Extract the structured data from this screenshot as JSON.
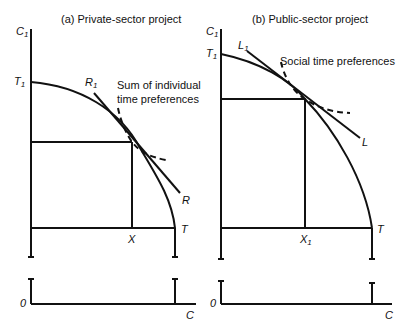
{
  "panels": [
    {
      "id": "a",
      "title": "(a) Private-sector project",
      "y_axis_label": "C",
      "y_axis_sub": "1",
      "x_axis_label": "C",
      "origin_label": "0",
      "curve_intercept_y": "T",
      "curve_intercept_y_sub": "1",
      "curve_intercept_x": "T",
      "tangent_top_label": "R",
      "tangent_top_sub": "1",
      "tangent_bottom_label": "R",
      "point_label": "X",
      "point_sub": "",
      "annotation_line1": "Sum of individual",
      "annotation_line2": "time preferences"
    },
    {
      "id": "b",
      "title": "(b) Public-sector project",
      "y_axis_label": "C",
      "y_axis_sub": "1",
      "x_axis_label": "C",
      "origin_label": "0",
      "curve_intercept_y": "T",
      "curve_intercept_y_sub": "1",
      "curve_intercept_x": "T",
      "tangent_top_label": "L",
      "tangent_top_sub": "1",
      "tangent_bottom_label": "L",
      "point_label": "X",
      "point_sub": "1",
      "annotation_line1": "Social time preferences",
      "annotation_line2": ""
    }
  ]
}
